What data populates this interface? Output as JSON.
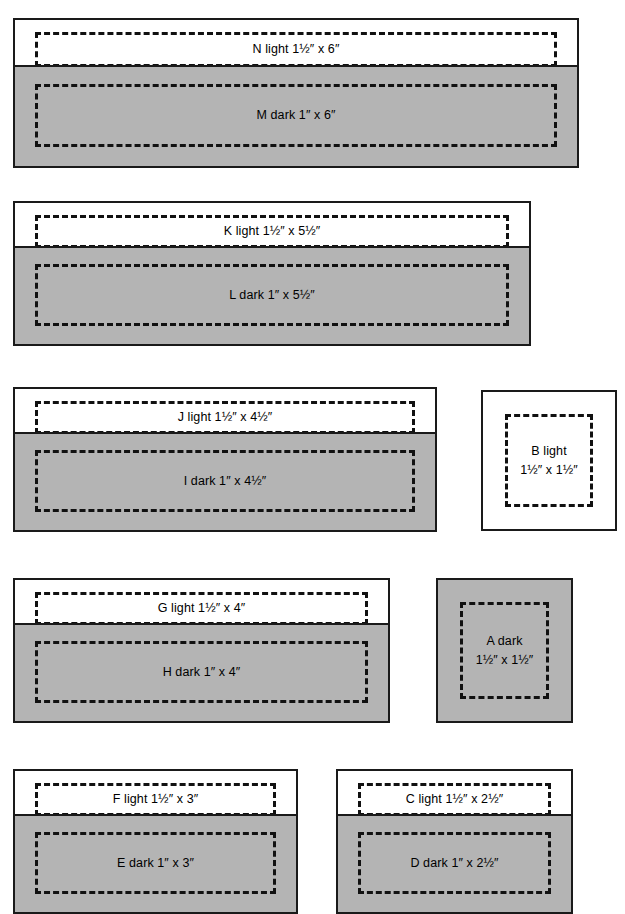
{
  "diagram": {
    "unit_mark": "″",
    "colors": {
      "light_fill": "#ffffff",
      "dark_fill": "#b4b4b4",
      "outline": "#1a1a1a",
      "dash": "#111111"
    },
    "groups": [
      {
        "id": "group-n-m",
        "bands": [
          {
            "piece": "N",
            "shade": "light",
            "label": "N light 1½″ x 6″",
            "size": "1½″ x 6″",
            "width_in": 6,
            "height_in": 1.5
          },
          {
            "piece": "M",
            "shade": "dark",
            "label": "M dark 1″ x 6″",
            "size": "1″ x 6″",
            "width_in": 6,
            "height_in": 1
          }
        ]
      },
      {
        "id": "group-k-l",
        "bands": [
          {
            "piece": "K",
            "shade": "light",
            "label": "K light 1½″ x 5½″",
            "size": "1½″ x 5½″",
            "width_in": 5.5,
            "height_in": 1.5
          },
          {
            "piece": "L",
            "shade": "dark",
            "label": "L dark 1″ x 5½″",
            "size": "1″ x 5½″",
            "width_in": 5.5,
            "height_in": 1
          }
        ]
      },
      {
        "id": "group-j-i",
        "bands": [
          {
            "piece": "J",
            "shade": "light",
            "label": "J light 1½″ x 4½″",
            "size": "1½″ x 4½″",
            "width_in": 4.5,
            "height_in": 1.5
          },
          {
            "piece": "I",
            "shade": "dark",
            "label": "I dark 1″ x 4½″",
            "size": "1″ x 4½″",
            "width_in": 4.5,
            "height_in": 1
          }
        ]
      },
      {
        "id": "group-b",
        "bands": [
          {
            "piece": "B",
            "shade": "light",
            "label": "B light",
            "label_line2": "1½″ x 1½″",
            "size": "1½″ x 1½″",
            "width_in": 1.5,
            "height_in": 1.5
          }
        ]
      },
      {
        "id": "group-g-h",
        "bands": [
          {
            "piece": "G",
            "shade": "light",
            "label": "G light 1½″ x 4″",
            "size": "1½″ x 4″",
            "width_in": 4,
            "height_in": 1.5
          },
          {
            "piece": "H",
            "shade": "dark",
            "label": "H dark 1″ x 4″",
            "size": "1″ x 4″",
            "width_in": 4,
            "height_in": 1
          }
        ]
      },
      {
        "id": "group-a",
        "bands": [
          {
            "piece": "A",
            "shade": "dark",
            "label": "A dark",
            "label_line2": "1½″ x 1½″",
            "size": "1½″ x 1½″",
            "width_in": 1.5,
            "height_in": 1.5
          }
        ]
      },
      {
        "id": "group-f-e",
        "bands": [
          {
            "piece": "F",
            "shade": "light",
            "label": "F light 1½″ x 3″",
            "size": "1½″ x 3″",
            "width_in": 3,
            "height_in": 1.5
          },
          {
            "piece": "E",
            "shade": "dark",
            "label": "E dark 1″ x 3″",
            "size": "1″ x 3″",
            "width_in": 3,
            "height_in": 1
          }
        ]
      },
      {
        "id": "group-c-d",
        "bands": [
          {
            "piece": "C",
            "shade": "light",
            "label": "C light 1½″ x 2½″",
            "size": "1½″ x 2½″",
            "width_in": 2.5,
            "height_in": 1.5
          },
          {
            "piece": "D",
            "shade": "dark",
            "label": "D dark 1″ x 2½″",
            "size": "1″ x 2½″",
            "width_in": 2.5,
            "height_in": 1
          }
        ]
      }
    ]
  }
}
